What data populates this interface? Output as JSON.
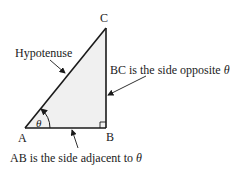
{
  "diagram": {
    "type": "right-triangle",
    "vertices": {
      "A": "A",
      "B": "B",
      "C": "C"
    },
    "angle_label": "θ",
    "labels": {
      "hypotenuse": "Hypotenuse",
      "opposite_prefix": "BC is the side opposite ",
      "opposite_symbol": "θ",
      "adjacent_prefix": "AB is the side adjacent to ",
      "adjacent_symbol": "θ"
    },
    "colors": {
      "fill": "#f0f0f0",
      "stroke": "#1a1a1a"
    }
  }
}
